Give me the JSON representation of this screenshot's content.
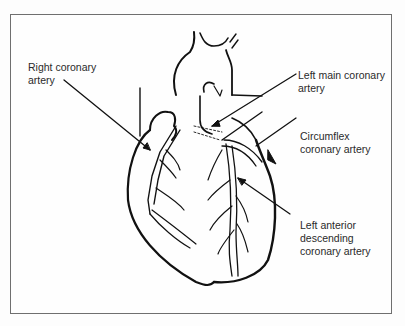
{
  "diagram": {
    "colors": {
      "line": "#111111",
      "frame": "#6f6f6f",
      "text": "#2a2a2a",
      "background": "#fdfdfd"
    },
    "labels": [
      {
        "id": "right-coronary",
        "text": "Right coronary\nartery"
      },
      {
        "id": "left-main-coronary",
        "text": "Left main coronary\nartery"
      },
      {
        "id": "circumflex-coronary",
        "text": "Circumflex\ncoronary artery"
      },
      {
        "id": "lad-coronary",
        "text": "Left anterior\ndescending\ncoronary artery"
      }
    ]
  }
}
